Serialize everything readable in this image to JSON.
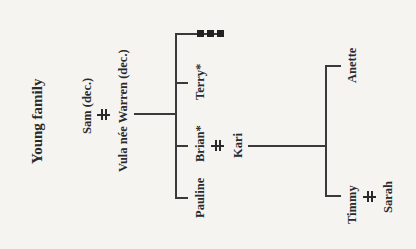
{
  "diagram": {
    "type": "family-tree",
    "orientation": "rotated-90-ccw",
    "title": "Young family",
    "generations": [
      {
        "couple": {
          "partner_a": "Sam (dec.)",
          "partner_b": "Vula née Warren (dec.)",
          "marriage_symbol": "double-bar"
        },
        "children": [
          "Pauline",
          "Brian*",
          "Terry*"
        ]
      },
      {
        "couple": {
          "partner_a": "Brian*",
          "partner_b": "Kari",
          "marriage_symbol": "double-bar"
        },
        "children": [
          "Timmy",
          "Anette"
        ]
      },
      {
        "couple": {
          "partner_a": "Timmy",
          "partner_b": "Sarah",
          "marriage_symbol": "double-bar"
        },
        "children": []
      }
    ],
    "terry_descendants_marker": "three-squares"
  },
  "labels": {
    "title": "Young family",
    "sam": "Sam (dec.)",
    "vula": "Vula née Warren (dec.)",
    "pauline": "Pauline",
    "brian": "Brian*",
    "terry": "Terry*",
    "kari": "Kari",
    "timmy": "Timmy",
    "anette": "Anette",
    "sarah": "Sarah"
  }
}
